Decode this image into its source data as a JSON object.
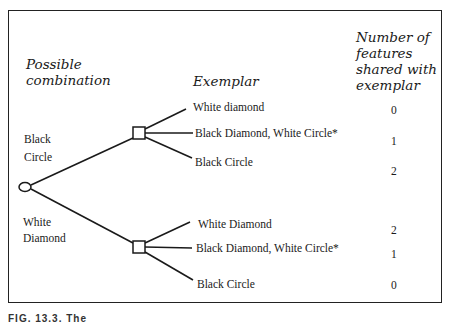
{
  "headers": {
    "possible_combination": [
      "Possible",
      "combination"
    ],
    "exemplar": "Exemplar",
    "features_shared": [
      "Number of",
      "features",
      "shared with",
      "exemplar"
    ]
  },
  "combinations": [
    {
      "label_lines": [
        "Black",
        "Circle"
      ]
    },
    {
      "label_lines": [
        "White",
        "Diamond"
      ]
    }
  ],
  "branches": [
    {
      "group": "Black Circle",
      "exemplars": [
        {
          "label": "White diamond",
          "shared": "0"
        },
        {
          "label": "Black Diamond, White Circle*",
          "shared": "1"
        },
        {
          "label": "Black Circle",
          "shared": "2"
        }
      ]
    },
    {
      "group": "White Diamond",
      "exemplars": [
        {
          "label": "White Diamond",
          "shared": "2"
        },
        {
          "label": "Black Diamond, White Circle*",
          "shared": "1"
        },
        {
          "label": "Black Circle",
          "shared": "0"
        }
      ]
    }
  ],
  "caption": "FIG. 13.3. The"
}
